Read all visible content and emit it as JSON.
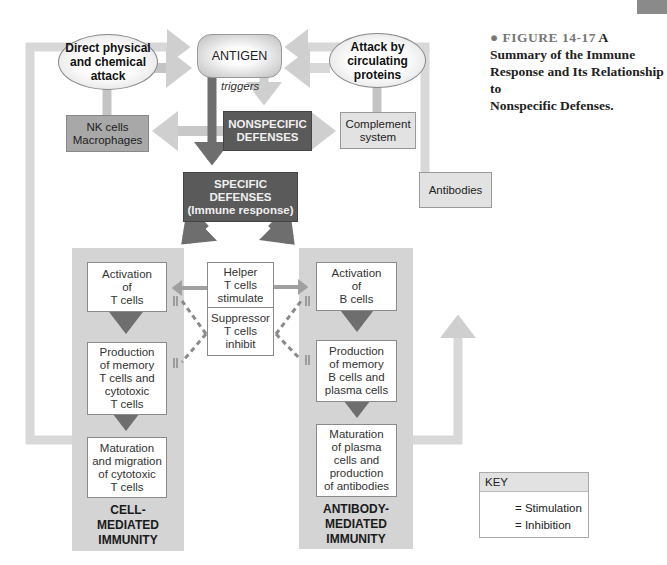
{
  "caption": {
    "figure_label": "FIGURE 14-17",
    "title_line1_suffix": "A",
    "title_line2": "Summary of the Immune",
    "title_line3": "Response and Its Relationship to",
    "title_line4": "Nonspecific Defenses."
  },
  "nodes": {
    "antigen": "ANTIGEN",
    "triggers": "triggers",
    "direct_attack": [
      "Direct physical",
      "and chemical",
      "attack"
    ],
    "circulating_attack": [
      "Attack by",
      "circulating",
      "proteins"
    ],
    "nk_cells": [
      "NK cells",
      "Macrophages"
    ],
    "nonspecific": [
      "NONSPECIFIC",
      "DEFENSES"
    ],
    "complement": [
      "Complement",
      "system"
    ],
    "specific": [
      "SPECIFIC",
      "DEFENSES",
      "(Immune response)"
    ],
    "antibodies": "Antibodies",
    "helper": [
      "Helper",
      "T cells",
      "stimulate"
    ],
    "suppressor": [
      "Suppressor",
      "T cells",
      "inhibit"
    ],
    "activation_t": [
      "Activation",
      "of",
      "T cells"
    ],
    "production_t": [
      "Production",
      "of memory",
      "T cells and",
      "cytotoxic",
      "T cells"
    ],
    "maturation_t": [
      "Maturation",
      "and migration",
      "of cytotoxic",
      "T cells"
    ],
    "activation_b": [
      "Activation",
      "of",
      "B cells"
    ],
    "production_b": [
      "Production",
      "of memory",
      "B cells and",
      "plasma cells"
    ],
    "maturation_b": [
      "Maturation",
      "of plasma",
      "cells and",
      "production",
      "of antibodies"
    ],
    "cell_mediated": [
      "CELL-",
      "MEDIATED",
      "IMMUNITY"
    ],
    "antibody_mediated": [
      "ANTIBODY-",
      "MEDIATED",
      "IMMUNITY"
    ]
  },
  "key": {
    "heading": "KEY",
    "stimulation": "= Stimulation",
    "inhibition": "= Inhibition"
  },
  "colors": {
    "light_arrow": "#cfcfcf",
    "dark_arrow": "#6e6e6e",
    "panel": "#d4d4d4",
    "dark_box": "#5a5a5a"
  }
}
